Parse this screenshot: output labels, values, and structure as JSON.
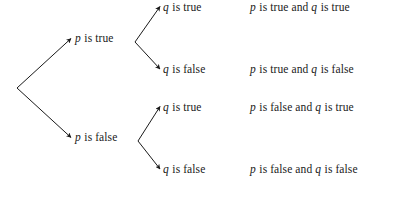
{
  "diagram": {
    "type": "probability-tree-diagram",
    "background_color": "#ffffff",
    "line_color": "#1a1a1a",
    "text_color": "#1a1a1a",
    "root": {
      "label": ""
    },
    "level1": [
      {
        "id": "p-true",
        "variable": "p",
        "rest": " is true"
      },
      {
        "id": "p-false",
        "variable": "p",
        "rest": " is false"
      }
    ],
    "level2": [
      {
        "id": "q-true-1",
        "variable": "q",
        "rest": " is true"
      },
      {
        "id": "q-false-1",
        "variable": "q",
        "rest": " is false"
      },
      {
        "id": "q-true-2",
        "variable": "q",
        "rest": " is true"
      },
      {
        "id": "q-false-2",
        "variable": "q",
        "rest": " is false"
      }
    ],
    "outcomes": [
      {
        "id": "outcome-tt",
        "var1": "p",
        "mid": " is true and ",
        "var2": "q",
        "end": " is true"
      },
      {
        "id": "outcome-tf",
        "var1": "p",
        "mid": " is true and ",
        "var2": "q",
        "end": " is false"
      },
      {
        "id": "outcome-ft",
        "var1": "p",
        "mid": " is false and ",
        "var2": "q",
        "end": " is true"
      },
      {
        "id": "outcome-ff",
        "var1": "p",
        "mid": " is false and ",
        "var2": "q",
        "end": " is false"
      }
    ]
  }
}
